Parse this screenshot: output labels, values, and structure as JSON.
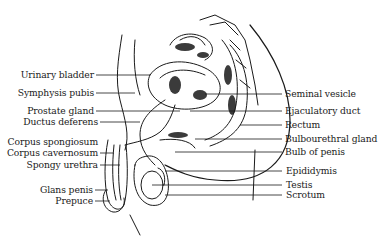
{
  "diagram": {
    "colors": {
      "ink": "#1a1a1a",
      "background": "#ffffff"
    },
    "labels_left": [
      {
        "text": "Urinary bladder",
        "y": 75
      },
      {
        "text": "Symphysis pubis",
        "y": 93
      },
      {
        "text": "Prostate gland",
        "y": 111
      },
      {
        "text": "Ductus deferens",
        "y": 122
      },
      {
        "text": "Corpus spongiosum",
        "y": 142
      },
      {
        "text": "Corpus cavernosum",
        "y": 153
      },
      {
        "text": "Spongy urethra",
        "y": 165
      },
      {
        "text": "Glans penis",
        "y": 190
      },
      {
        "text": "Prepuce",
        "y": 201
      }
    ],
    "labels_right": [
      {
        "text": "Seminal vesicle",
        "y": 94
      },
      {
        "text": "Ejaculatory duct",
        "y": 111
      },
      {
        "text": "Rectum",
        "y": 125
      },
      {
        "text": "Bulbourethral gland",
        "y": 139
      },
      {
        "text": "Bulb of penis",
        "y": 152
      },
      {
        "text": "Epididymis",
        "y": 171
      },
      {
        "text": "Testis",
        "y": 185
      },
      {
        "text": "Scrotum",
        "y": 195
      }
    ]
  }
}
